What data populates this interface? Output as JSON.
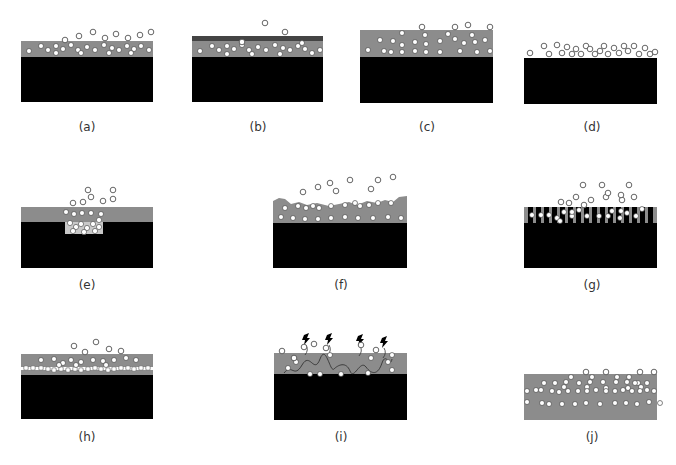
{
  "colors": {
    "substrate": "#000000",
    "coating": "#8c8c8c",
    "coating_light": "#c8c8c8",
    "top_layer": "#444444",
    "particle_fill": "#ffffff",
    "particle_stroke": "#555555",
    "background": "#ffffff"
  },
  "panels": [
    {
      "id": "a",
      "label": "(a)",
      "x": 21,
      "y": 41,
      "w": 132,
      "layers": [
        {
          "type": "coating",
          "h": 16
        },
        {
          "type": "substrate",
          "h": 45
        }
      ],
      "label_x": 87,
      "label_y": 120,
      "free": [
        [
          58,
          -5
        ],
        [
          72,
          -9
        ],
        [
          84,
          -3
        ],
        [
          95,
          -7
        ],
        [
          107,
          -3
        ],
        [
          119,
          -6
        ],
        [
          130,
          -9
        ],
        [
          44,
          -1
        ]
      ],
      "embedded": [
        [
          8,
          10
        ],
        [
          20,
          5
        ],
        [
          27,
          9
        ],
        [
          35,
          5
        ],
        [
          42,
          8
        ],
        [
          50,
          4
        ],
        [
          57,
          9
        ],
        [
          66,
          6
        ],
        [
          74,
          9
        ],
        [
          83,
          4
        ],
        [
          91,
          7
        ],
        [
          98,
          9
        ],
        [
          106,
          5
        ],
        [
          113,
          8
        ],
        [
          120,
          5
        ],
        [
          128,
          9
        ],
        [
          35,
          12
        ],
        [
          60,
          12
        ],
        [
          88,
          12
        ],
        [
          110,
          12
        ]
      ]
    },
    {
      "id": "b",
      "label": "(b)",
      "x": 192,
      "y": 36,
      "w": 131,
      "layers": [
        {
          "type": "top_layer",
          "h": 5
        },
        {
          "type": "coating",
          "h": 16
        },
        {
          "type": "substrate",
          "h": 45
        }
      ],
      "label_x": 258,
      "label_y": 120,
      "free": [
        [
          50,
          6
        ],
        [
          73,
          -13
        ],
        [
          93,
          -4
        ]
      ],
      "embedded": [
        [
          8,
          15
        ],
        [
          20,
          10
        ],
        [
          27,
          14
        ],
        [
          35,
          10
        ],
        [
          42,
          13
        ],
        [
          50,
          9
        ],
        [
          57,
          14
        ],
        [
          66,
          11
        ],
        [
          74,
          14
        ],
        [
          83,
          9
        ],
        [
          91,
          12
        ],
        [
          98,
          14
        ],
        [
          106,
          10
        ],
        [
          113,
          13
        ],
        [
          120,
          17
        ],
        [
          128,
          14
        ],
        [
          35,
          18
        ],
        [
          60,
          18
        ],
        [
          88,
          18
        ],
        [
          110,
          7
        ]
      ]
    },
    {
      "id": "c",
      "label": "(c)",
      "x": 360,
      "y": 30,
      "w": 133,
      "layers": [
        {
          "type": "coating",
          "h": 27
        },
        {
          "type": "substrate",
          "h": 46
        }
      ],
      "label_x": 427,
      "label_y": 120,
      "free": [
        [
          62,
          -3
        ],
        [
          95,
          -3
        ],
        [
          130,
          -3
        ],
        [
          108,
          -5
        ]
      ],
      "embedded": [
        [
          42,
          3
        ],
        [
          65,
          5
        ],
        [
          88,
          4
        ],
        [
          112,
          5
        ],
        [
          20,
          10
        ],
        [
          33,
          11
        ],
        [
          42,
          15
        ],
        [
          55,
          12
        ],
        [
          66,
          14
        ],
        [
          80,
          11
        ],
        [
          95,
          9
        ],
        [
          104,
          13
        ],
        [
          115,
          12
        ],
        [
          125,
          10
        ],
        [
          8,
          20
        ],
        [
          24,
          21
        ],
        [
          31,
          22
        ],
        [
          42,
          22
        ],
        [
          55,
          21
        ],
        [
          66,
          22
        ],
        [
          80,
          22
        ],
        [
          100,
          21
        ],
        [
          117,
          22
        ],
        [
          130,
          21
        ]
      ]
    },
    {
      "id": "d",
      "label": "(d)",
      "x": 524,
      "y": 58,
      "w": 133,
      "layers": [
        {
          "type": "substrate",
          "h": 46
        }
      ],
      "label_x": 592,
      "label_y": 120,
      "free": [
        [
          6,
          -5
        ],
        [
          20,
          -12
        ],
        [
          25,
          -4
        ],
        [
          33,
          -13
        ],
        [
          38,
          -5
        ],
        [
          43,
          -11
        ],
        [
          48,
          -4
        ],
        [
          52,
          -9
        ],
        [
          57,
          -4
        ],
        [
          62,
          -12
        ],
        [
          66,
          -9
        ],
        [
          71,
          -4
        ],
        [
          76,
          -7
        ],
        [
          80,
          -12
        ],
        [
          84,
          -4
        ],
        [
          90,
          -10
        ],
        [
          95,
          -5
        ],
        [
          100,
          -12
        ],
        [
          104,
          -7
        ],
        [
          110,
          -12
        ],
        [
          115,
          -4
        ],
        [
          121,
          -10
        ],
        [
          126,
          -4
        ],
        [
          131,
          -6
        ]
      ],
      "embedded": []
    },
    {
      "id": "e",
      "label": "(e)",
      "x": 21,
      "y": 207,
      "w": 132,
      "layers": [
        {
          "type": "coating",
          "h": 15
        },
        {
          "type": "substrate",
          "h": 46
        }
      ],
      "label_x": 87,
      "label_y": 278,
      "free": [
        [
          52,
          -4
        ],
        [
          62,
          -5
        ],
        [
          70,
          -10
        ],
        [
          82,
          -6
        ],
        [
          92,
          -8
        ],
        [
          67,
          -17
        ],
        [
          92,
          -17
        ]
      ],
      "embedded": [
        [
          45,
          5
        ],
        [
          53,
          7
        ],
        [
          61,
          6
        ],
        [
          70,
          6
        ],
        [
          80,
          7
        ]
      ],
      "pocket": {
        "x": 44,
        "y": 15,
        "w": 38,
        "h": 12,
        "particles": [
          [
            49,
            16
          ],
          [
            55,
            20
          ],
          [
            60,
            17
          ],
          [
            66,
            21
          ],
          [
            72,
            17
          ],
          [
            78,
            20
          ],
          [
            52,
            24
          ],
          [
            63,
            25
          ],
          [
            74,
            24
          ],
          [
            78,
            13
          ]
        ]
      }
    },
    {
      "id": "f",
      "label": "(f)",
      "x": 273,
      "y": 195,
      "w": 134,
      "layers": [
        {
          "type": "rough_coating",
          "h": 28
        },
        {
          "type": "substrate",
          "h": 45
        }
      ],
      "label_x": 341,
      "label_y": 278,
      "free": [
        [
          30,
          -3
        ],
        [
          45,
          -8
        ],
        [
          57,
          -12
        ],
        [
          63,
          -4
        ],
        [
          77,
          -15
        ],
        [
          98,
          -6
        ],
        [
          105,
          -15
        ],
        [
          120,
          -18
        ]
      ],
      "embedded": [
        [
          12,
          13
        ],
        [
          25,
          11
        ],
        [
          33,
          13
        ],
        [
          40,
          11
        ],
        [
          46,
          13
        ],
        [
          58,
          11
        ],
        [
          72,
          10
        ],
        [
          82,
          8
        ],
        [
          87,
          11
        ],
        [
          96,
          10
        ],
        [
          105,
          8
        ],
        [
          118,
          8
        ],
        [
          8,
          22
        ],
        [
          20,
          23
        ],
        [
          32,
          24
        ],
        [
          45,
          24
        ],
        [
          58,
          23
        ],
        [
          72,
          22
        ],
        [
          85,
          23
        ],
        [
          100,
          23
        ],
        [
          115,
          22
        ],
        [
          128,
          23
        ]
      ]
    },
    {
      "id": "g",
      "label": "(g)",
      "x": 524,
      "y": 207,
      "w": 133,
      "layers": [
        {
          "type": "striped",
          "h": 16
        },
        {
          "type": "substrate",
          "h": 45
        }
      ],
      "label_x": 592,
      "label_y": 278,
      "free": [
        [
          59,
          -22
        ],
        [
          78,
          -22
        ],
        [
          105,
          -22
        ],
        [
          52,
          -10
        ],
        [
          67,
          -7
        ],
        [
          82,
          -10
        ],
        [
          98,
          -7
        ],
        [
          110,
          -10
        ],
        [
          37,
          -5
        ],
        [
          45,
          -4
        ],
        [
          60,
          -2
        ],
        [
          84,
          -14
        ],
        [
          97,
          -12
        ]
      ],
      "embedded": [
        [
          8,
          8
        ],
        [
          17,
          8
        ],
        [
          25,
          8
        ],
        [
          33,
          11
        ],
        [
          40,
          5
        ],
        [
          48,
          9
        ],
        [
          55,
          3
        ],
        [
          63,
          9
        ],
        [
          75,
          9
        ],
        [
          84,
          9
        ],
        [
          88,
          4
        ],
        [
          96,
          11
        ],
        [
          103,
          6
        ],
        [
          112,
          9
        ],
        [
          118,
          2
        ],
        [
          36,
          14
        ],
        [
          48,
          5
        ],
        [
          97,
          4
        ]
      ]
    },
    {
      "id": "h",
      "label": "(h)",
      "x": 21,
      "y": 354,
      "w": 132,
      "layers": [
        {
          "type": "coating_with_stripe",
          "h": 21
        },
        {
          "type": "substrate",
          "h": 44
        }
      ],
      "label_x": 87,
      "label_y": 430,
      "free": [
        [
          53,
          -8
        ],
        [
          75,
          -12
        ],
        [
          64,
          -2
        ],
        [
          88,
          -5
        ],
        [
          100,
          -3
        ]
      ],
      "embedded": [
        [
          20,
          6
        ],
        [
          33,
          5
        ],
        [
          42,
          9
        ],
        [
          50,
          6
        ],
        [
          60,
          8
        ],
        [
          72,
          6
        ],
        [
          82,
          7
        ],
        [
          93,
          6
        ],
        [
          105,
          4
        ],
        [
          115,
          6
        ],
        [
          38,
          11
        ],
        [
          55,
          11
        ],
        [
          85,
          11
        ]
      ],
      "row_particles": [
        [
          5,
          14
        ],
        [
          12,
          14
        ],
        [
          20,
          14
        ],
        [
          27,
          15
        ],
        [
          33,
          16
        ],
        [
          40,
          15
        ],
        [
          47,
          16
        ],
        [
          54,
          15
        ],
        [
          60,
          16
        ],
        [
          67,
          15
        ],
        [
          74,
          14
        ],
        [
          80,
          15
        ],
        [
          87,
          16
        ],
        [
          93,
          15
        ],
        [
          100,
          14
        ],
        [
          107,
          14
        ],
        [
          113,
          15
        ],
        [
          120,
          14
        ],
        [
          127,
          14
        ]
      ]
    },
    {
      "id": "i",
      "label": "(i)",
      "x": 274,
      "y": 353,
      "w": 133,
      "layers": [
        {
          "type": "coating",
          "h": 21
        },
        {
          "type": "substrate",
          "h": 46
        }
      ],
      "label_x": 341,
      "label_y": 430,
      "free": [
        [
          30,
          -6
        ],
        [
          40,
          -9
        ],
        [
          8,
          -2
        ],
        [
          52,
          -5
        ],
        [
          87,
          -8
        ],
        [
          102,
          -3
        ],
        [
          20,
          5
        ]
      ],
      "embedded": [
        [
          20,
          5
        ],
        [
          56,
          2
        ],
        [
          97,
          5
        ],
        [
          118,
          2
        ],
        [
          14,
          15
        ],
        [
          22,
          9
        ],
        [
          46,
          21
        ],
        [
          94,
          20
        ],
        [
          114,
          9
        ],
        [
          118,
          17
        ],
        [
          36,
          21
        ],
        [
          67,
          21
        ]
      ],
      "lightning": [
        [
          30,
          -18
        ],
        [
          53,
          -18
        ],
        [
          84,
          -17
        ],
        [
          108,
          -15
        ]
      ]
    },
    {
      "id": "j",
      "label": "(j)",
      "x": 524,
      "y": 374,
      "w": 133,
      "layers": [
        {
          "type": "coating",
          "h": 46
        }
      ],
      "label_x": 592,
      "label_y": 430,
      "free": [
        [
          62,
          -2
        ],
        [
          82,
          -2
        ],
        [
          116,
          -2
        ],
        [
          130,
          -2
        ]
      ],
      "embedded": [
        [
          47,
          3
        ],
        [
          68,
          3
        ],
        [
          93,
          3
        ],
        [
          105,
          3
        ],
        [
          114,
          9
        ],
        [
          20,
          9
        ],
        [
          31,
          9
        ],
        [
          42,
          8
        ],
        [
          55,
          9
        ],
        [
          66,
          8
        ],
        [
          79,
          8
        ],
        [
          92,
          8
        ],
        [
          103,
          8
        ],
        [
          111,
          9
        ],
        [
          123,
          9
        ],
        [
          40,
          13
        ],
        [
          63,
          13
        ],
        [
          82,
          14
        ],
        [
          104,
          14
        ],
        [
          117,
          13
        ],
        [
          3,
          17
        ],
        [
          12,
          16
        ],
        [
          17,
          16
        ],
        [
          28,
          17
        ],
        [
          35,
          18
        ],
        [
          44,
          17
        ],
        [
          54,
          17
        ],
        [
          63,
          17
        ],
        [
          72,
          16
        ],
        [
          82,
          17
        ],
        [
          91,
          17
        ],
        [
          99,
          16
        ],
        [
          108,
          17
        ],
        [
          116,
          17
        ],
        [
          123,
          16
        ],
        [
          130,
          17
        ],
        [
          3,
          28
        ],
        [
          18,
          29
        ],
        [
          25,
          30
        ],
        [
          38,
          30
        ],
        [
          51,
          30
        ],
        [
          62,
          29
        ],
        [
          76,
          30
        ],
        [
          91,
          29
        ],
        [
          102,
          29
        ],
        [
          113,
          30
        ],
        [
          125,
          28
        ],
        [
          136,
          29
        ]
      ]
    }
  ]
}
